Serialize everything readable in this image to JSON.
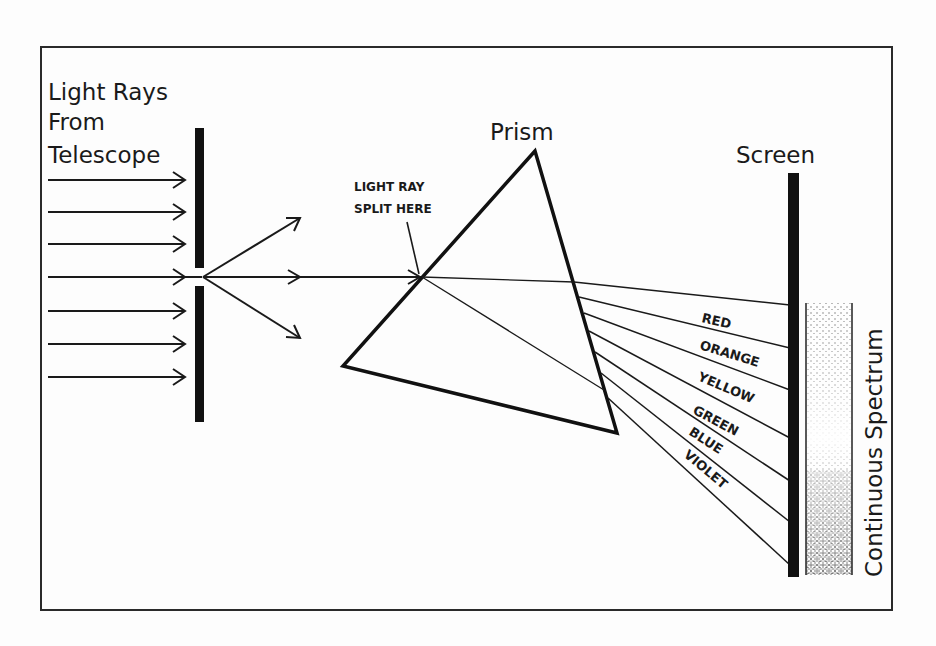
{
  "diagram": {
    "title_labels": {
      "source": [
        "Light Rays",
        "From",
        "Telescope"
      ],
      "prism": "Prism",
      "screen": "Screen",
      "spectrum": "Continuous Spectrum",
      "split_note": [
        "LIGHT RAY",
        "SPLIT HERE"
      ]
    },
    "colors": {
      "line": "#1a1a1a",
      "background": "#fdfdfd",
      "frame": "#2a2a2a"
    },
    "spectrum_bands": [
      {
        "label": "RED",
        "rotation": 13
      },
      {
        "label": "ORANGE",
        "rotation": 17
      },
      {
        "label": "YELLOW",
        "rotation": 23
      },
      {
        "label": "GREEN",
        "rotation": 28
      },
      {
        "label": "BLUE",
        "rotation": 33
      },
      {
        "label": "VIOLET",
        "rotation": 40
      }
    ],
    "incoming_ray_count": 7
  }
}
